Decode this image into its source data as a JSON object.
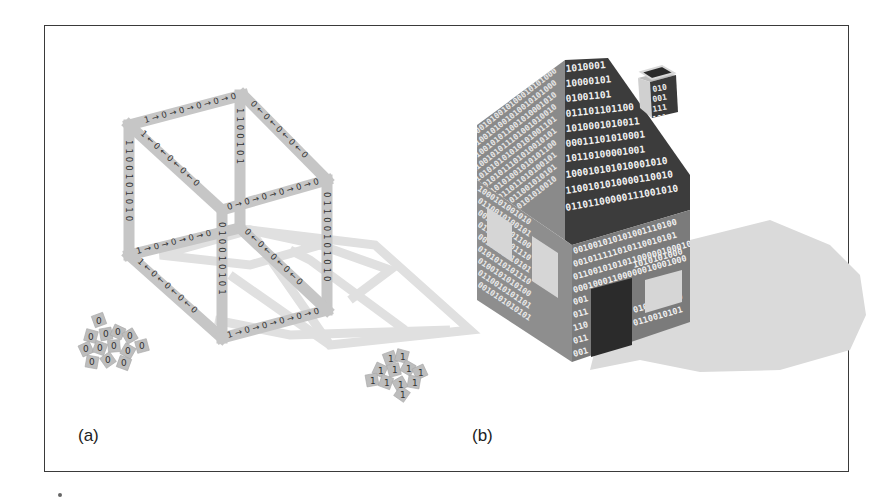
{
  "figure": {
    "panels": [
      {
        "id": "a",
        "label": "(a)",
        "subject": "wireframe cube made of binary-labelled beams",
        "edges": {
          "top_front": "1→0→0→0→0→0",
          "top_left": "1←0←0←0←0",
          "top_right": "0←0←0←0←0",
          "back_vertical": "1100101",
          "left_vertical": "1100101010",
          "front_vertical": "01001010",
          "right_vertical": "01100101010",
          "middle_horizontal": "0→0→0→0→0→0",
          "bottom_left": "1→0→0→0→0",
          "bottom_front": "1→0→0→0→0→0",
          "bottom_left_diag": "1←0←0←0←0",
          "inner_diag": "0←0←0←0←0"
        },
        "tile_piles": [
          {
            "name": "zeros-pile",
            "digit": "0"
          },
          {
            "name": "ones-pile",
            "digit": "1"
          }
        ]
      },
      {
        "id": "b",
        "label": "(b)",
        "subject": "house built from binary digits",
        "roof_front_rows": [
          "1010001",
          "10000101",
          "01001101",
          "011101101100",
          "1010001010011",
          "00011101010001",
          "10110100001001",
          "100010101010001010",
          "1100101010000110010",
          "01101100000111001010"
        ],
        "front_wall_rows": [
          "001001010101001110100",
          "001011111010110010101",
          "011001010101100000100010",
          "00010001100000010001000"
        ],
        "front_wall_left_column": [
          "001",
          "011",
          "110",
          "011",
          "001",
          "011"
        ],
        "front_wall_right_rows": [
          "1010101000",
          "0101010100",
          "0110010101"
        ],
        "side_wall_rows": [
          "1000101001010",
          "0110010100101",
          "0010010101100",
          "0110010101110",
          "0010101010101",
          "0101010101110",
          "0100101010100",
          "0110010101101",
          "0010101010101"
        ],
        "chimney_rows": [
          "010",
          "001",
          "111",
          "101"
        ]
      }
    ],
    "colors": {
      "beam": "#c8c8c8",
      "beam_text": "#333333",
      "cube_shadow": "#e0e0e0",
      "roof_dark": "#3c3c3c",
      "wall_mid": "#7d7d7d",
      "side_wall": "#8e8e8e",
      "door": "#2b2b2b",
      "window": "#d6d6d6",
      "house_shadow": "#dadada",
      "frame": "#3a3a3a"
    }
  }
}
